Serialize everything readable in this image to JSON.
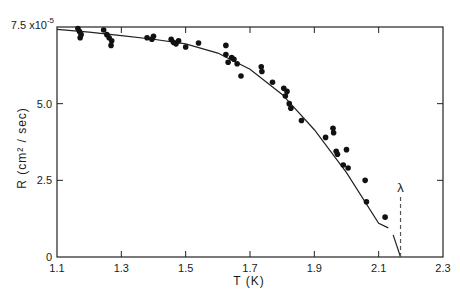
{
  "chart_data": {
    "type": "scatter",
    "title": "",
    "xlabel": "T (K)",
    "ylabel": "R (cm² / sec)",
    "y_multiplier_label": "7.5 x10⁻⁵",
    "xlim": [
      1.1,
      2.3
    ],
    "ylim": [
      0,
      7.5
    ],
    "x_ticks": [
      1.1,
      1.3,
      1.5,
      1.7,
      1.9,
      2.1,
      2.3
    ],
    "x_tick_labels": [
      "1.1",
      "1.3",
      "1.5",
      "1.7",
      "1.9",
      "2.1",
      "2.3"
    ],
    "y_ticks": [
      0,
      2.5,
      5.0,
      7.5
    ],
    "y_tick_labels": [
      "0",
      "2.5",
      "5.0",
      "7.5 x10⁻⁵"
    ],
    "grid": false,
    "legend": null,
    "series": [
      {
        "name": "measured",
        "kind": "scatter",
        "points": [
          [
            1.165,
            7.45
          ],
          [
            1.17,
            7.35
          ],
          [
            1.175,
            7.25
          ],
          [
            1.172,
            7.15
          ],
          [
            1.245,
            7.4
          ],
          [
            1.255,
            7.25
          ],
          [
            1.262,
            7.15
          ],
          [
            1.27,
            7.05
          ],
          [
            1.268,
            6.9
          ],
          [
            1.38,
            7.15
          ],
          [
            1.395,
            7.1
          ],
          [
            1.4,
            7.2
          ],
          [
            1.455,
            7.1
          ],
          [
            1.462,
            7.0
          ],
          [
            1.47,
            6.95
          ],
          [
            1.478,
            7.05
          ],
          [
            1.5,
            6.85
          ],
          [
            1.54,
            6.98
          ],
          [
            1.625,
            6.9
          ],
          [
            1.625,
            6.6
          ],
          [
            1.632,
            6.35
          ],
          [
            1.643,
            6.5
          ],
          [
            1.65,
            6.45
          ],
          [
            1.66,
            6.3
          ],
          [
            1.672,
            5.9
          ],
          [
            1.735,
            6.2
          ],
          [
            1.737,
            6.05
          ],
          [
            1.77,
            5.7
          ],
          [
            1.805,
            5.5
          ],
          [
            1.815,
            5.4
          ],
          [
            1.81,
            5.25
          ],
          [
            1.822,
            5.0
          ],
          [
            1.827,
            4.85
          ],
          [
            1.86,
            4.45
          ],
          [
            1.935,
            3.9
          ],
          [
            1.958,
            4.2
          ],
          [
            1.96,
            4.05
          ],
          [
            1.968,
            3.45
          ],
          [
            1.972,
            3.35
          ],
          [
            2.0,
            3.5
          ],
          [
            1.99,
            3.0
          ],
          [
            2.005,
            2.9
          ],
          [
            2.058,
            2.5
          ],
          [
            2.062,
            1.8
          ],
          [
            2.12,
            1.3
          ]
        ]
      },
      {
        "name": "fit",
        "kind": "line",
        "points": [
          [
            1.1,
            7.42
          ],
          [
            1.2,
            7.33
          ],
          [
            1.3,
            7.22
          ],
          [
            1.4,
            7.1
          ],
          [
            1.5,
            6.95
          ],
          [
            1.6,
            6.65
          ],
          [
            1.7,
            6.12
          ],
          [
            1.8,
            5.3
          ],
          [
            1.9,
            4.15
          ],
          [
            2.0,
            2.75
          ],
          [
            2.1,
            1.1
          ],
          [
            2.13,
            0.95
          ]
        ],
        "gap_after_point": [
          2.135,
          0.95
        ],
        "resume_segment": [
          [
            2.145,
            0.72
          ],
          [
            2.168,
            0.0
          ]
        ]
      }
    ],
    "annotations": [
      {
        "text": "λ",
        "x": 2.168,
        "y": 2.25,
        "type": "vertical-dashed-line",
        "from_y": 0,
        "to_y": 2.05
      }
    ]
  }
}
